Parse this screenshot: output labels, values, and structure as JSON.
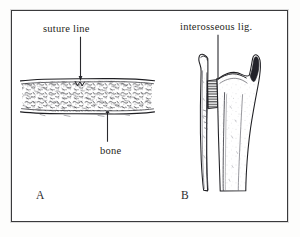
{
  "figure": {
    "caption_letters": [
      "A",
      "B"
    ],
    "background_color": "#ffffff",
    "frame_color": "#3a3a3c",
    "ink_color": "#1f1f21"
  },
  "panel_a": {
    "letter": "A",
    "subject": "suture joint cross-section",
    "labels": {
      "suture_line": "suture line",
      "bone": "bone"
    },
    "leader_lines": [
      {
        "name": "suture-line-leader",
        "from_label": "suture line",
        "points_to": "interdigitating suture band"
      },
      {
        "name": "bone-leader",
        "from_label": "bone",
        "points_to": "cancellous bone band"
      }
    ]
  },
  "panel_b": {
    "letter": "B",
    "subject": "syndesmosis with interosseous ligament",
    "labels": {
      "interosseous_lig": "interosseous lig."
    },
    "leader_lines": [
      {
        "name": "interosseous-leader",
        "from_label": "interosseous lig.",
        "points_to": "hatched ligament band between bones"
      }
    ]
  }
}
